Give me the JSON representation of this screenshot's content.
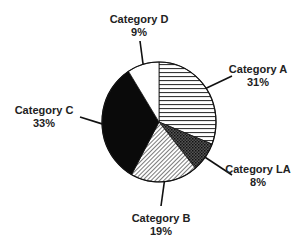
{
  "chart_data": {
    "type": "pie",
    "title": "",
    "categories": [
      "Category A",
      "Category LA",
      "Category B",
      "Category C",
      "Category D"
    ],
    "values": [
      31,
      8,
      19,
      33,
      9
    ],
    "unit": "%",
    "start_angle": "12 o'clock",
    "direction": "clockwise",
    "fills": [
      "horizontal-lines",
      "dense-crosshatch",
      "diagonal-hatch",
      "solid-black",
      "white"
    ],
    "legend": "none (direct labels with leader lines)"
  },
  "labels": [
    {
      "name": "Category A",
      "pct": "31%"
    },
    {
      "name": "Category LA",
      "pct": "8%"
    },
    {
      "name": "Category B",
      "pct": "19%"
    },
    {
      "name": "Category C",
      "pct": "33%"
    },
    {
      "name": "Category D",
      "pct": "9%"
    }
  ],
  "colors": {
    "ink": "#111111",
    "background": "#ffffff"
  }
}
